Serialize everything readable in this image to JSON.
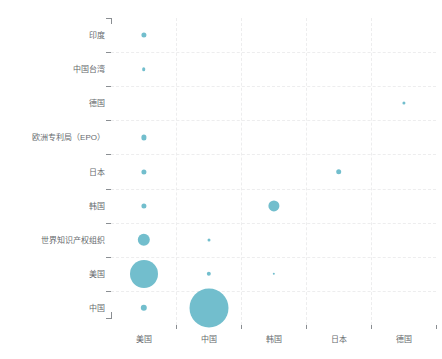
{
  "chart_data": {
    "type": "scatter",
    "title": "",
    "subtitle": "",
    "xlabel": "",
    "ylabel": "",
    "legend": [],
    "grid": true,
    "bubble_color": "#72becd",
    "grid_color": "#ededee",
    "axis_color": "#8a8e92",
    "label_color": "#666a6e",
    "categories_x": [
      "美国",
      "中国",
      "韩国",
      "日本",
      "德国"
    ],
    "categories_y": [
      "印度",
      "中国台湾",
      "德国",
      "欧洲专利局（EPO）",
      "日本",
      "韩国",
      "世界知识产权组织",
      "美国",
      "中国"
    ],
    "points": [
      {
        "x": "美国",
        "y": "印度",
        "size": 2.6
      },
      {
        "x": "美国",
        "y": "中国台湾",
        "size": 1.8
      },
      {
        "x": "德国",
        "y": "德国",
        "size": 1.6
      },
      {
        "x": "美国",
        "y": "欧洲专利局（EPO）",
        "size": 2.6
      },
      {
        "x": "美国",
        "y": "日本",
        "size": 2.6
      },
      {
        "x": "日本",
        "y": "日本",
        "size": 2.8
      },
      {
        "x": "美国",
        "y": "韩国",
        "size": 2.6
      },
      {
        "x": "韩国",
        "y": "韩国",
        "size": 5.6
      },
      {
        "x": "美国",
        "y": "世界知识产权组织",
        "size": 6.2
      },
      {
        "x": "中国",
        "y": "世界知识产权组织",
        "size": 1.5
      },
      {
        "x": "美国",
        "y": "美国",
        "size": 14.0
      },
      {
        "x": "中国",
        "y": "美国",
        "size": 2.2
      },
      {
        "x": "韩国",
        "y": "美国",
        "size": 1.2
      },
      {
        "x": "美国",
        "y": "中国",
        "size": 3.2
      },
      {
        "x": "中国",
        "y": "中国",
        "size": 19.5
      }
    ]
  }
}
